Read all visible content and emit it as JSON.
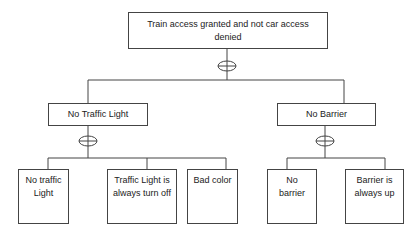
{
  "diagram": {
    "type": "fault-tree",
    "root": {
      "label": "Train access granted and not car access denied"
    },
    "gates": {
      "root_gate": "OR",
      "left_gate": "OR",
      "right_gate": "OR"
    },
    "level1": [
      {
        "label": "No Traffic Light"
      },
      {
        "label": "No Barrier"
      }
    ],
    "leaves": [
      {
        "label": "No traffic Light",
        "parent": "No Traffic Light"
      },
      {
        "label": "Traffic Light is always turn off",
        "parent": "No Traffic Light"
      },
      {
        "label": "Bad color",
        "parent": "No Traffic Light"
      },
      {
        "label": "No barrier",
        "parent": "No Barrier"
      },
      {
        "label": "Barrier is always up",
        "parent": "No Barrier"
      }
    ]
  }
}
